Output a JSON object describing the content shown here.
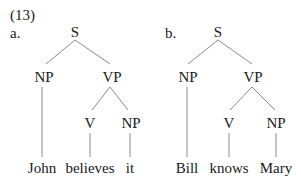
{
  "example_number": "(13)",
  "trees": [
    {
      "label": "a.",
      "nodes": {
        "root": "S",
        "subject": "NP",
        "predicate": "VP",
        "verb": "V",
        "object": "NP"
      },
      "words": [
        "John",
        "believes",
        "it"
      ]
    },
    {
      "label": "b.",
      "nodes": {
        "root": "S",
        "subject": "NP",
        "predicate": "VP",
        "verb": "V",
        "object": "NP"
      },
      "words": [
        "Bill",
        "knows",
        "Mary"
      ]
    }
  ],
  "colors": {
    "text": "#1a1a1a",
    "edge": "#8a8a8a",
    "background": "#ffffff"
  }
}
